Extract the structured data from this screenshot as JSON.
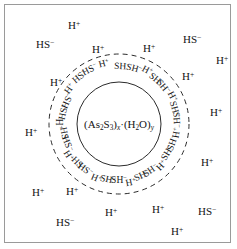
{
  "figure": {
    "kind": "colloidal-micelle-diagram",
    "border_color": "#9a9a9a",
    "background_color": "#ffffff",
    "ink_color": "#141414"
  },
  "nucleus": {
    "label_plain": "(As2S3)x*(H2O)y",
    "parts": {
      "open": "(As",
      "sub1": "2",
      "s": "S",
      "sub2": "3",
      "close": ")",
      "x": "x",
      "dot": "·",
      "open2": "(H",
      "sub3": "2",
      "o": "O",
      "close2": ")",
      "y": "y"
    },
    "circle": {
      "cx": 114,
      "cy": 119,
      "r": 42,
      "stroke": "#2b2b2b",
      "style": "solid"
    }
  },
  "adsorption_layer": {
    "circle": {
      "cx": 114,
      "cy": 119,
      "r": 70,
      "stroke": "#2b2b2b",
      "style": "dashed",
      "dash": "5 4"
    },
    "note": "ions rotated tangentially between inner solid circle and outer dashed circle",
    "ions": [
      {
        "text": "H+",
        "angle": -104,
        "radius": 62
      },
      {
        "text": "HS-",
        "angle": -118,
        "radius": 61
      },
      {
        "text": "HS-",
        "angle": -130,
        "radius": 61
      },
      {
        "text": "H+",
        "angle": -144,
        "radius": 60
      },
      {
        "text": "HS-",
        "angle": -156,
        "radius": 56
      },
      {
        "text": "HS-",
        "angle": -168,
        "radius": 56
      },
      {
        "text": "H+",
        "angle": 180,
        "radius": 61
      },
      {
        "text": "HS-",
        "angle": 169,
        "radius": 56
      },
      {
        "text": "HS-",
        "angle": 159,
        "radius": 56
      },
      {
        "text": "H+",
        "angle": 148,
        "radius": 60
      },
      {
        "text": "HS-",
        "angle": 136,
        "radius": 57
      },
      {
        "text": "HS-",
        "angle": 126,
        "radius": 57
      },
      {
        "text": "H+",
        "angle": 113,
        "radius": 60
      },
      {
        "text": "SH-",
        "angle": 101,
        "radius": 57
      },
      {
        "text": "SH-",
        "angle": 90,
        "radius": 57
      },
      {
        "text": "H+",
        "angle": 78,
        "radius": 60
      },
      {
        "text": "SH-",
        "angle": 66,
        "radius": 57
      },
      {
        "text": "SH-",
        "angle": 56,
        "radius": 57
      },
      {
        "text": "H+",
        "angle": 44,
        "radius": 60
      },
      {
        "text": "SH-",
        "angle": 31,
        "radius": 57
      },
      {
        "text": "SH-",
        "angle": 20,
        "radius": 57
      },
      {
        "text": "H+",
        "angle": 9,
        "radius": 59
      },
      {
        "text": "SH-",
        "angle": -4,
        "radius": 57
      },
      {
        "text": "SH-",
        "angle": -15,
        "radius": 57
      },
      {
        "text": "H+",
        "angle": -27,
        "radius": 59
      },
      {
        "text": "SH-",
        "angle": -40,
        "radius": 57
      },
      {
        "text": "SH-",
        "angle": -50,
        "radius": 57
      },
      {
        "text": "H+",
        "angle": -62,
        "radius": 60
      },
      {
        "text": "SH-",
        "angle": -75,
        "radius": 57
      },
      {
        "text": "SH-",
        "angle": -87,
        "radius": 57
      }
    ]
  },
  "diffuse_layer": {
    "note": "upright ions scattered outside the dashed circle",
    "ions": [
      {
        "text": "H+",
        "x": 63,
        "y": 15
      },
      {
        "text": "HS-",
        "x": 31,
        "y": 34
      },
      {
        "text": "H+",
        "x": 87,
        "y": 39
      },
      {
        "text": "H+",
        "x": 138,
        "y": 38
      },
      {
        "text": "HS-",
        "x": 178,
        "y": 29
      },
      {
        "text": "H+",
        "x": 211,
        "y": 50
      },
      {
        "text": "H+",
        "x": 45,
        "y": 72
      },
      {
        "text": "H+",
        "x": 177,
        "y": 66
      },
      {
        "text": "H+",
        "x": 205,
        "y": 102
      },
      {
        "text": "H+",
        "x": 20,
        "y": 122
      },
      {
        "text": "H+",
        "x": 196,
        "y": 152
      },
      {
        "text": "H+",
        "x": 27,
        "y": 182
      },
      {
        "text": "H+",
        "x": 61,
        "y": 181
      },
      {
        "text": "H+",
        "x": 100,
        "y": 202
      },
      {
        "text": "H+",
        "x": 147,
        "y": 199
      },
      {
        "text": "HS-",
        "x": 193,
        "y": 201
      },
      {
        "text": "HS-",
        "x": 51,
        "y": 212
      },
      {
        "text": "H+",
        "x": 166,
        "y": 221
      }
    ]
  }
}
